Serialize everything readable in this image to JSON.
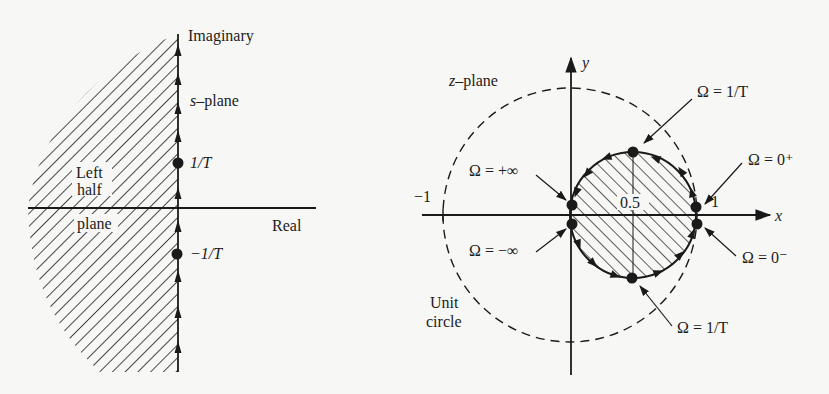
{
  "figure": {
    "s_plane": {
      "axis_vertical_label": "Imaginary",
      "axis_horizontal_label": "Real",
      "plane_label_var": "s",
      "plane_label_rest": "–plane",
      "region_label_line1": "Left",
      "region_label_line2": "half",
      "region_label_line3": "plane",
      "point_upper_label": "1/T",
      "point_lower_label": "−1/T"
    },
    "z_plane": {
      "plane_label_var": "z",
      "plane_label_rest": "–plane",
      "axis_x_label": "x",
      "axis_y_label": "y",
      "tick_neg_one": "−1",
      "tick_one": "1",
      "tick_half": "0.5",
      "unit_circle_line1": "Unit",
      "unit_circle_line2": "circle",
      "annotations": {
        "top": "Ω = 1/T",
        "plus_inf": "Ω = +∞",
        "zero_plus": "Ω = 0⁺",
        "minus_inf": "Ω = −∞",
        "zero_minus": "Ω = 0⁻",
        "bottom": "Ω = 1/T"
      }
    },
    "colors": {
      "ink": "#1a1a1a",
      "paper": "#f7f7f5"
    }
  }
}
